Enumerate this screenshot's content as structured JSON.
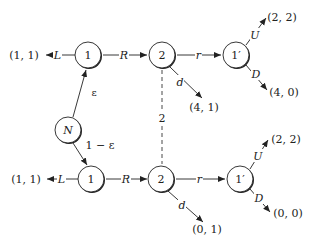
{
  "diagram": {
    "type": "extensive-form game tree",
    "nature_node": {
      "label": "N"
    },
    "probabilities": {
      "top": "ε",
      "bottom": "1 − ε"
    },
    "top_branch": {
      "player1": {
        "label": "1",
        "left_action": "L",
        "right_action": "R",
        "left_payoff": "(1, 1)"
      },
      "player2": {
        "label": "2",
        "continue_action": "r",
        "down_action": "d",
        "down_payoff": "(4, 1)"
      },
      "player1prime": {
        "label": "1′",
        "up_action": "U",
        "down_action": "D",
        "up_payoff": "(2, 2)",
        "down_payoff": "(4, 0)"
      }
    },
    "bottom_branch": {
      "player1": {
        "label": "1",
        "left_action": "L",
        "right_action": "R",
        "left_payoff": "(1, 1)"
      },
      "player2": {
        "label": "2",
        "continue_action": "r",
        "down_action": "d",
        "down_payoff": "(0, 1)"
      },
      "player1prime": {
        "label": "1′",
        "up_action": "U",
        "down_action": "D",
        "up_payoff": "(2, 2)",
        "down_payoff": "(0, 0)"
      }
    },
    "information_set": {
      "label": "2"
    }
  }
}
